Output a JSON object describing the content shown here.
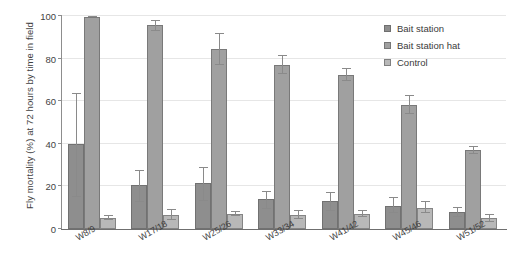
{
  "chart_data": {
    "type": "bar",
    "title": "",
    "xlabel": "",
    "ylabel": "Fly mortality (%) at 72 hours by time in field",
    "ylim": [
      0,
      100
    ],
    "yticks": [
      0,
      20,
      40,
      60,
      80,
      100
    ],
    "grid": true,
    "legend_position": "top-right",
    "categories": [
      "W8/9",
      "W17/18",
      "W25/26",
      "W33/34",
      "W41/42",
      "W45/46",
      "W51/52"
    ],
    "series": [
      {
        "name": "Bait station",
        "color": "#8e8e8e",
        "values": [
          40,
          20.5,
          21.5,
          14,
          13,
          11,
          8
        ],
        "err_low": [
          25,
          8,
          8.5,
          4.5,
          4.5,
          3.5,
          2.5
        ],
        "err_high": [
          24,
          7,
          7.5,
          4,
          4.5,
          4,
          2.5
        ]
      },
      {
        "name": "Bait station hat",
        "color": "#a0a0a0",
        "values": [
          99.5,
          96,
          84.5,
          77,
          72.5,
          58,
          37
        ],
        "err_low": [
          0,
          3,
          7.5,
          4,
          3,
          4,
          2
        ],
        "err_high": [
          0.5,
          2,
          7.5,
          4.5,
          3,
          5,
          2
        ]
      },
      {
        "name": "Control",
        "color": "#b8b8b8",
        "values": [
          5,
          6.5,
          7,
          6.5,
          7,
          10,
          5
        ],
        "err_low": [
          1,
          2.5,
          1,
          2,
          1.5,
          2.5,
          1.5
        ],
        "err_high": [
          1.5,
          3,
          1.5,
          2.5,
          2,
          3,
          2
        ]
      }
    ]
  },
  "axis": {
    "ylabel": "Fly mortality (%) at 72 hours by time in field",
    "ytick_labels": [
      "0",
      "20",
      "40",
      "60",
      "80",
      "100"
    ],
    "xtick_labels": [
      "W8/9",
      "W17/18",
      "W25/26",
      "W33/34",
      "W41/42",
      "W45/46",
      "W51/52"
    ]
  },
  "legend": {
    "items": [
      {
        "label": "Bait station",
        "swatch": "legend-swatch-bait-station"
      },
      {
        "label": "Bait station hat",
        "swatch": "legend-swatch-bait-station-hat"
      },
      {
        "label": "Control",
        "swatch": "legend-swatch-control"
      }
    ]
  }
}
